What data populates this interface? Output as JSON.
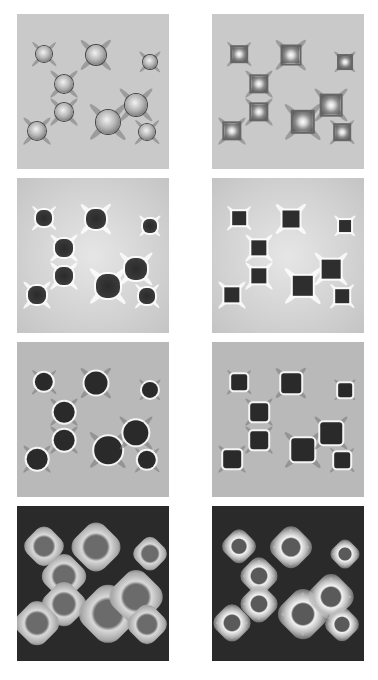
{
  "figure": {
    "layout": {
      "columns": 2,
      "rows": 4
    },
    "panel_size": {
      "w": 152,
      "h": 155
    },
    "columns_x": [
      17,
      212
    ],
    "rows_y": [
      14,
      178,
      342,
      506
    ],
    "particle_sites": [
      {
        "x": 27,
        "y": 40,
        "r": 8
      },
      {
        "x": 79,
        "y": 41,
        "r": 10
      },
      {
        "x": 133,
        "y": 48,
        "r": 7
      },
      {
        "x": 47,
        "y": 70,
        "r": 9
      },
      {
        "x": 47,
        "y": 98,
        "r": 9
      },
      {
        "x": 91,
        "y": 108,
        "r": 12
      },
      {
        "x": 119,
        "y": 91,
        "r": 11
      },
      {
        "x": 20,
        "y": 117,
        "r": 9
      },
      {
        "x": 130,
        "y": 118,
        "r": 8
      }
    ],
    "panels": [
      {
        "row": 0,
        "col": 0,
        "shape": "circle",
        "style": "r1c",
        "bg": "p-r1"
      },
      {
        "row": 0,
        "col": 1,
        "shape": "square",
        "style": "r1s",
        "bg": "p-r1"
      },
      {
        "row": 1,
        "col": 0,
        "shape": "circle",
        "style": "r2c",
        "bg": "p-r2"
      },
      {
        "row": 1,
        "col": 1,
        "shape": "square",
        "style": "r2s",
        "bg": "p-r2"
      },
      {
        "row": 2,
        "col": 0,
        "shape": "circle",
        "style": "r3c",
        "bg": "p-r3"
      },
      {
        "row": 2,
        "col": 1,
        "shape": "square",
        "style": "r3s",
        "bg": "p-r3"
      },
      {
        "row": 3,
        "col": 0,
        "shape": "circle",
        "style": "r4c",
        "bg": "p-r4"
      },
      {
        "row": 3,
        "col": 1,
        "shape": "square",
        "style": "r4s",
        "bg": "p-r4"
      }
    ]
  }
}
